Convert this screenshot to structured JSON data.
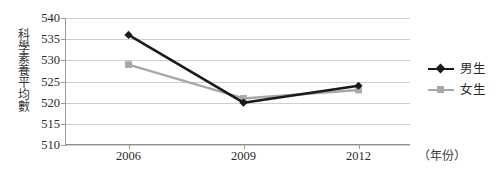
{
  "chart_data": {
    "type": "line",
    "title": "",
    "subtitle": "",
    "xlabel": "（年份）",
    "ylabel": "科學素養平均數",
    "categories": [
      "2006",
      "2009",
      "2012"
    ],
    "x_tick_labels": [
      "2006",
      "2009",
      "2012"
    ],
    "y_tick_labels": [
      "540",
      "535",
      "530",
      "525",
      "520",
      "515",
      "510"
    ],
    "y_ticks": [
      540,
      535,
      530,
      525,
      520,
      515,
      510
    ],
    "ylim": [
      510,
      540
    ],
    "grid": true,
    "legend_position": "right",
    "series": [
      {
        "name": "男生",
        "values": [
          536,
          520,
          524
        ],
        "color": "#1a1a1a",
        "marker": "diamond"
      },
      {
        "name": "女生",
        "values": [
          529,
          521,
          523
        ],
        "color": "#a8a8a8",
        "marker": "square"
      }
    ]
  },
  "legend": {
    "items": [
      {
        "label": "男生",
        "color": "#1a1a1a",
        "marker": "diamond-marker-icon"
      },
      {
        "label": "女生",
        "color": "#a8a8a8",
        "marker": "square-marker-icon"
      }
    ]
  },
  "axes": {
    "y_title": "科學素養平均數",
    "x_title": "（年份）"
  }
}
